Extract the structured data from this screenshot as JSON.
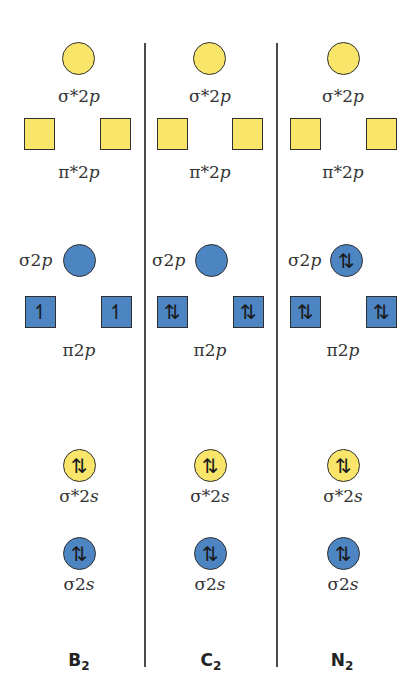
{
  "colors": {
    "antibonding": "#f8e56a",
    "bonding": "#4d85c2",
    "outline": "#2f2f2f"
  },
  "orbital_labels": {
    "sigma_star_2p": "σ*2p",
    "pi_star_2p": "π*2p",
    "sigma_2p": "σ2p",
    "pi_2p": "π2p",
    "sigma_star_2s": "σ*2s",
    "sigma_2s": "σ2s"
  },
  "molecules": [
    {
      "name": "B",
      "subscript": "2",
      "sigma_star_2p": "",
      "pi_star_2p": [
        "",
        ""
      ],
      "sigma_2p": "",
      "pi_2p": [
        "↿",
        "↿"
      ],
      "sigma_star_2s": "⇅",
      "sigma_2s": "⇅"
    },
    {
      "name": "C",
      "subscript": "2",
      "sigma_star_2p": "",
      "pi_star_2p": [
        "",
        ""
      ],
      "sigma_2p": "",
      "pi_2p": [
        "⇅",
        "⇅"
      ],
      "sigma_star_2s": "⇅",
      "sigma_2s": "⇅"
    },
    {
      "name": "N",
      "subscript": "2",
      "sigma_star_2p": "",
      "pi_star_2p": [
        "",
        ""
      ],
      "sigma_2p": "⇅",
      "pi_2p": [
        "⇅",
        "⇅"
      ],
      "sigma_star_2s": "⇅",
      "sigma_2s": "⇅"
    }
  ]
}
